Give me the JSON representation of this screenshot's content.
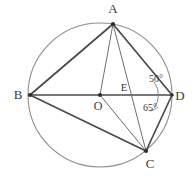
{
  "figure": {
    "kind": "circle-geometry-diagram",
    "colors": {
      "background": "#ffffff",
      "circle_stroke": "#8d8d8d",
      "chord_strong": "#4a4a4a",
      "chord_thin": "#6f6f6f",
      "label_text": "#3b3b3b",
      "arc_mark": "#7a7a7a",
      "dot": "#2e2e2e"
    },
    "circle": {
      "cx": 100,
      "cy": 95,
      "r": 72
    },
    "points": [
      {
        "id": "A",
        "label": "A",
        "x": 113,
        "y": 24,
        "label_x": 113,
        "label_y": 13,
        "on_circle": true
      },
      {
        "id": "B",
        "label": "B",
        "x": 30,
        "y": 95,
        "label_x": 18,
        "label_y": 99,
        "on_circle": true
      },
      {
        "id": "C",
        "label": "C",
        "x": 146,
        "y": 151,
        "label_x": 150,
        "label_y": 168,
        "on_circle": true
      },
      {
        "id": "D",
        "label": "D",
        "x": 172,
        "y": 95,
        "label_x": 180,
        "label_y": 100,
        "on_circle": true
      },
      {
        "id": "O",
        "label": "O",
        "x": 100,
        "y": 95,
        "label_x": 98,
        "label_y": 110,
        "on_circle": false
      },
      {
        "id": "E",
        "label": "E",
        "x": 133,
        "y": 95,
        "label_x": 124,
        "label_y": 91,
        "on_circle": false
      }
    ],
    "segments": [
      {
        "id": "AB",
        "from": "A",
        "to": "B",
        "weight": "strong"
      },
      {
        "id": "AD",
        "from": "A",
        "to": "D",
        "weight": "strong"
      },
      {
        "id": "BD",
        "from": "B",
        "to": "D",
        "weight": "strong"
      },
      {
        "id": "BC",
        "from": "B",
        "to": "C",
        "weight": "strong"
      },
      {
        "id": "CD",
        "from": "C",
        "to": "D",
        "weight": "strong"
      },
      {
        "id": "AO",
        "from": "A",
        "to": "O",
        "weight": "thin"
      },
      {
        "id": "AC",
        "from": "A",
        "to": "C",
        "weight": "thin"
      },
      {
        "id": "OC",
        "from": "O",
        "to": "C",
        "weight": "thin"
      }
    ],
    "angles": [
      {
        "id": "angle-adb",
        "value": "50°",
        "vertex": "D",
        "label_x": 156,
        "label_y": 82
      },
      {
        "id": "angle-bdc",
        "value": "65°",
        "vertex": "D",
        "label_x": 150,
        "label_y": 111
      }
    ]
  }
}
